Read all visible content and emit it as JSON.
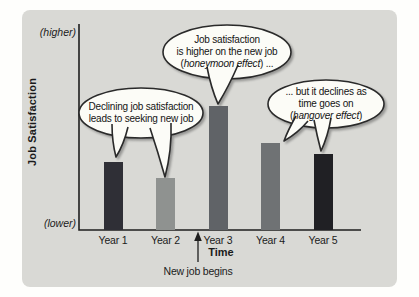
{
  "chart_data": {
    "type": "bar",
    "title": "",
    "xlabel": "Time",
    "ylabel": "Job Satisfaction",
    "y_axis_top_label": "(higher)",
    "y_axis_bottom_label": "(lower)",
    "categories": [
      "Year 1",
      "Year 2",
      "Year 3",
      "Year 4",
      "Year 5"
    ],
    "values": [
      33,
      25,
      60,
      42,
      37
    ],
    "ylim": [
      0,
      100
    ],
    "grid": false,
    "legend": false,
    "bar_colors": [
      "#2f2f36",
      "#8f9290",
      "#606367",
      "#6f7274",
      "#202024"
    ],
    "x_axis_note": {
      "text": "New job begins",
      "position": "between Year 2 and Year 3, arrow pointing up at axis"
    },
    "annotations": [
      {
        "id": "honeymoon-bubble",
        "points_to": "Year 3 bar",
        "lines": [
          "Job satisfaction",
          "is higher on the new job"
        ],
        "italic_line": {
          "prefix": "(",
          "italic": "honeymoon effect",
          "suffix": ") ..."
        }
      },
      {
        "id": "declining-bubble",
        "points_to": "Year 1 and Year 2 bars",
        "lines": [
          "Declining job satisfaction",
          "leads to seeking new job"
        ],
        "italic_line": {
          "prefix": "",
          "italic": "",
          "suffix": ""
        }
      },
      {
        "id": "hangover-bubble",
        "points_to": "Year 4 and Year 5 bars",
        "lines": [
          "... but it declines as",
          "time goes on"
        ],
        "italic_line": {
          "prefix": "(",
          "italic": "hangover effect",
          "suffix": ")"
        }
      }
    ],
    "palette": {
      "panel_background": "#d9d9d5",
      "page_background": "#fefefc",
      "axis_color": "#1e1e1e",
      "bubble_fill": "#fcfcf7",
      "bubble_stroke": "#2a2a2a"
    }
  }
}
